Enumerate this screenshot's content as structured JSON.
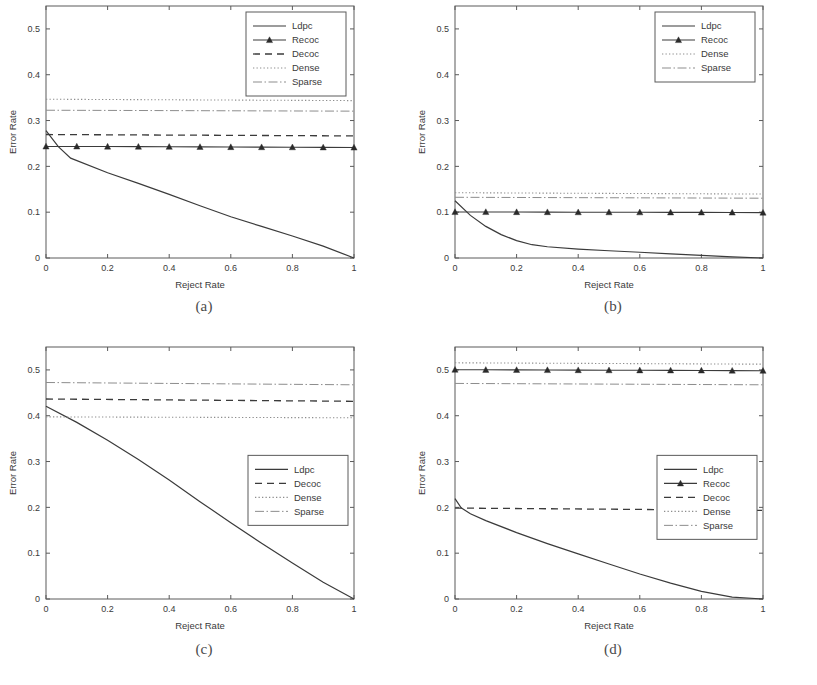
{
  "figure": {
    "panels": [
      {
        "id": "a",
        "caption": "(a)",
        "chart_data": {
          "type": "line",
          "title": "",
          "xlabel": "Reject Rate",
          "ylabel": "Error Rate",
          "xlim": [
            0,
            1
          ],
          "ylim": [
            0,
            0.55
          ],
          "xticks": [
            0,
            0.2,
            0.4,
            0.6,
            0.8,
            1
          ],
          "xticklabels": [
            "0",
            "0.2",
            "0.4",
            "0.6",
            "0.8",
            "1"
          ],
          "yticks": [
            0,
            0.1,
            0.2,
            0.3,
            0.4,
            0.5
          ],
          "yticklabels": [
            "0",
            "0.1",
            "0.2",
            "0.3",
            "0.4",
            "0.5"
          ],
          "grid": false,
          "legend_position": "upper right",
          "series": [
            {
              "name": "Ldpc",
              "style": "solid",
              "x": [
                0,
                0.04,
                0.08,
                0.2,
                0.3,
                0.4,
                0.5,
                0.6,
                0.7,
                0.8,
                0.9,
                1
              ],
              "values": [
                0.278,
                0.243,
                0.218,
                0.186,
                0.163,
                0.139,
                0.114,
                0.09,
                0.069,
                0.048,
                0.026,
                0.0
              ]
            },
            {
              "name": "Recoc",
              "style": "solid-marker",
              "x": [
                0,
                0.1,
                0.2,
                0.3,
                0.4,
                0.5,
                0.6,
                0.7,
                0.8,
                0.9,
                1
              ],
              "values": [
                0.2435,
                0.2435,
                0.2432,
                0.243,
                0.2428,
                0.2425,
                0.2422,
                0.242,
                0.2418,
                0.2415,
                0.2412
              ]
            },
            {
              "name": "Decoc",
              "style": "dashed",
              "x": [
                0,
                1
              ],
              "values": [
                0.2695,
                0.2665
              ]
            },
            {
              "name": "Dense",
              "style": "dotted",
              "x": [
                0,
                1
              ],
              "values": [
                0.3465,
                0.3435
              ]
            },
            {
              "name": "Sparse",
              "style": "dashdot",
              "x": [
                0,
                1
              ],
              "values": [
                0.3225,
                0.3205
              ]
            }
          ],
          "legend": [
            "Ldpc",
            "Recoc",
            "Decoc",
            "Dense",
            "Sparse"
          ]
        }
      },
      {
        "id": "b",
        "caption": "(b)",
        "chart_data": {
          "type": "line",
          "title": "",
          "xlabel": "Reject Rate",
          "ylabel": "Error Rate",
          "xlim": [
            0,
            1
          ],
          "ylim": [
            0,
            0.55
          ],
          "xticks": [
            0,
            0.2,
            0.4,
            0.6,
            0.8,
            1
          ],
          "xticklabels": [
            "0",
            "0.2",
            "0.4",
            "0.6",
            "0.8",
            "1"
          ],
          "yticks": [
            0,
            0.1,
            0.2,
            0.3,
            0.4,
            0.5
          ],
          "yticklabels": [
            "0",
            "0.1",
            "0.2",
            "0.3",
            "0.4",
            "0.5"
          ],
          "grid": false,
          "legend_position": "upper right",
          "series": [
            {
              "name": "Ldpc",
              "style": "solid",
              "x": [
                0,
                0.05,
                0.1,
                0.15,
                0.2,
                0.25,
                0.3,
                0.4,
                0.5,
                0.6,
                0.7,
                0.8,
                0.9,
                1
              ],
              "values": [
                0.125,
                0.093,
                0.069,
                0.051,
                0.038,
                0.029,
                0.0245,
                0.0195,
                0.0158,
                0.0125,
                0.0092,
                0.0058,
                0.0025,
                0.0
              ]
            },
            {
              "name": "Recoc",
              "style": "solid-marker",
              "x": [
                0,
                0.1,
                0.2,
                0.3,
                0.4,
                0.5,
                0.6,
                0.7,
                0.8,
                0.9,
                1
              ],
              "values": [
                0.1005,
                0.1005,
                0.1003,
                0.1002,
                0.1,
                0.0999,
                0.0998,
                0.0996,
                0.0995,
                0.0993,
                0.0991
              ]
            },
            {
              "name": "Dense",
              "style": "dotted",
              "x": [
                0,
                1
              ],
              "values": [
                0.1425,
                0.1395
              ]
            },
            {
              "name": "Sparse",
              "style": "dashdot",
              "x": [
                0,
                1
              ],
              "values": [
                0.1325,
                0.1305
              ]
            }
          ],
          "legend": [
            "Ldpc",
            "Recoc",
            "Dense",
            "Sparse"
          ]
        }
      },
      {
        "id": "c",
        "caption": "(c)",
        "chart_data": {
          "type": "line",
          "title": "",
          "xlabel": "Reject Rate",
          "ylabel": "Error Rate",
          "xlim": [
            0,
            1
          ],
          "ylim": [
            0,
            0.55
          ],
          "xticks": [
            0,
            0.2,
            0.4,
            0.6,
            0.8,
            1
          ],
          "xticklabels": [
            "0",
            "0.2",
            "0.4",
            "0.6",
            "0.8",
            "1"
          ],
          "yticks": [
            0,
            0.1,
            0.2,
            0.3,
            0.4,
            0.5
          ],
          "yticklabels": [
            "0",
            "0.1",
            "0.2",
            "0.3",
            "0.4",
            "0.5"
          ],
          "grid": false,
          "legend_position": "center right",
          "series": [
            {
              "name": "Ldpc",
              "style": "solid",
              "x": [
                0,
                0.1,
                0.2,
                0.3,
                0.4,
                0.5,
                0.6,
                0.7,
                0.8,
                0.9,
                1
              ],
              "values": [
                0.4205,
                0.3855,
                0.3465,
                0.3045,
                0.2595,
                0.2125,
                0.1665,
                0.1215,
                0.0785,
                0.0365,
                0.0
              ]
            },
            {
              "name": "Decoc",
              "style": "dashed",
              "x": [
                0,
                1
              ],
              "values": [
                0.4365,
                0.4315
              ]
            },
            {
              "name": "Dense",
              "style": "dotted",
              "x": [
                0,
                1
              ],
              "values": [
                0.3975,
                0.3955
              ]
            },
            {
              "name": "Sparse",
              "style": "dashdot",
              "x": [
                0,
                1
              ],
              "values": [
                0.4725,
                0.4675
              ]
            }
          ],
          "legend": [
            "Ldpc",
            "Decoc",
            "Dense",
            "Sparse"
          ]
        }
      },
      {
        "id": "d",
        "caption": "(d)",
        "chart_data": {
          "type": "line",
          "title": "",
          "xlabel": "Reject Rate",
          "ylabel": "Error Rate",
          "xlim": [
            0,
            1
          ],
          "ylim": [
            0,
            0.55
          ],
          "xticks": [
            0,
            0.2,
            0.4,
            0.6,
            0.8,
            1
          ],
          "xticklabels": [
            "0",
            "0.2",
            "0.4",
            "0.6",
            "0.8",
            "1"
          ],
          "yticks": [
            0,
            0.1,
            0.2,
            0.3,
            0.4,
            0.5
          ],
          "yticklabels": [
            "0",
            "0.1",
            "0.2",
            "0.3",
            "0.4",
            "0.5"
          ],
          "grid": false,
          "legend_position": "center right",
          "series": [
            {
              "name": "Ldpc",
              "style": "solid",
              "x": [
                0,
                0.02,
                0.05,
                0.1,
                0.2,
                0.3,
                0.4,
                0.5,
                0.6,
                0.7,
                0.8,
                0.9,
                1
              ],
              "values": [
                0.219,
                0.199,
                0.186,
                0.171,
                0.145,
                0.121,
                0.0985,
                0.0765,
                0.0545,
                0.0345,
                0.0165,
                0.004,
                0.0
              ]
            },
            {
              "name": "Recoc",
              "style": "solid-marker",
              "x": [
                0,
                0.1,
                0.2,
                0.3,
                0.4,
                0.5,
                0.6,
                0.7,
                0.8,
                0.9,
                1
              ],
              "values": [
                0.5005,
                0.5002,
                0.5,
                0.4998,
                0.4996,
                0.4994,
                0.4992,
                0.499,
                0.4988,
                0.4985,
                0.4982
              ]
            },
            {
              "name": "Decoc",
              "style": "dashed",
              "x": [
                0,
                1
              ],
              "values": [
                0.1985,
                0.1935
              ]
            },
            {
              "name": "Dense",
              "style": "dotted",
              "x": [
                0,
                1
              ],
              "values": [
                0.5155,
                0.5125
              ]
            },
            {
              "name": "Sparse",
              "style": "dashdot",
              "x": [
                0,
                1
              ],
              "values": [
                0.4705,
                0.4675
              ]
            }
          ],
          "legend": [
            "Ldpc",
            "Recoc",
            "Decoc",
            "Dense",
            "Sparse"
          ]
        }
      }
    ]
  }
}
